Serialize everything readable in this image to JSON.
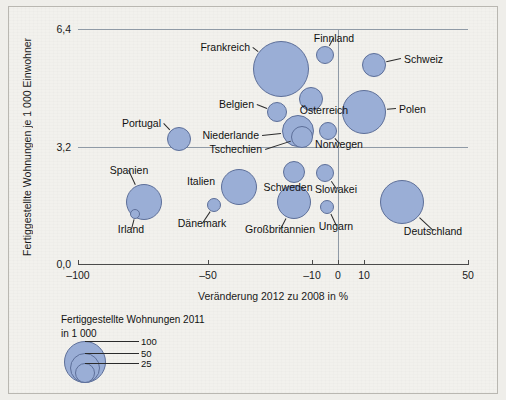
{
  "chart_data": {
    "type": "scatter",
    "title": "",
    "xlabel": "Veränderung 2012 zu 2008 in %",
    "ylabel": "Fertiggestellte Wohnungen je 1 000 Einwohner",
    "xlim": [
      -100,
      50
    ],
    "ylim": [
      0.0,
      6.4
    ],
    "xticks": [
      "-100",
      "-50",
      "-10",
      "0",
      "10",
      "50"
    ],
    "xtick_values": [
      -100,
      -50,
      -10,
      0,
      10,
      50
    ],
    "yticks": [
      "6,4",
      "3,2",
      "0,0"
    ],
    "ytick_values": [
      6.4,
      3.2,
      0.0
    ],
    "grid": true,
    "legend_position": "below-left",
    "size_legend": {
      "title_line1": "Fertiggestellte Wohnungen 2011",
      "title_line2": "in 1 000",
      "values": [
        "100",
        "50",
        "25"
      ]
    },
    "size_unit": "1000 Wohnungen (2011)",
    "points": [
      {
        "label": "Frankreich",
        "x": -22.0,
        "y": 5.35,
        "size": 100,
        "px": 272,
        "py": 62,
        "r": 28,
        "label_side": "r",
        "lx": 241,
        "ly": 40
      },
      {
        "label": "Finnland",
        "x": -9.5,
        "y": 5.8,
        "size": 15,
        "px": 316,
        "py": 48,
        "r": 9,
        "label_side": "c",
        "lx": 325,
        "ly": 31
      },
      {
        "label": "Schweiz",
        "x": 7.0,
        "y": 5.45,
        "size": 22,
        "px": 365,
        "py": 58,
        "r": 12,
        "label_side": "l",
        "lx": 395,
        "ly": 52
      },
      {
        "label": "Belgien",
        "x": -23.5,
        "y": 4.25,
        "size": 18,
        "px": 268,
        "py": 105,
        "r": 10,
        "label_side": "r",
        "lx": 245,
        "ly": 97
      },
      {
        "label": "Österreich",
        "x": -13.0,
        "y": 4.35,
        "size": 22,
        "px": 302,
        "py": 92,
        "r": 12,
        "label_side": "c",
        "lx": 315,
        "ly": 103
      },
      {
        "label": "Polen",
        "x": 1.5,
        "y": 4.25,
        "size": 70,
        "px": 355,
        "py": 105,
        "r": 22,
        "label_side": "l",
        "lx": 390,
        "ly": 102
      },
      {
        "label": "Portugal",
        "x": -61.0,
        "y": 3.6,
        "size": 27,
        "px": 170,
        "py": 132,
        "r": 12,
        "label_side": "r",
        "lx": 152,
        "ly": 116
      },
      {
        "label": "Niederlande",
        "x": -17.0,
        "y": 3.75,
        "size": 55,
        "px": 289,
        "py": 124,
        "r": 16,
        "label_side": "r",
        "lx": 250,
        "ly": 128
      },
      {
        "label": "Tschechien",
        "x": -16.0,
        "y": 3.55,
        "size": 30,
        "px": 293,
        "py": 130,
        "r": 11,
        "label_side": "r",
        "lx": 253,
        "ly": 142
      },
      {
        "label": "Norwegen",
        "x": -9.0,
        "y": 3.8,
        "size": 14,
        "px": 319,
        "py": 124,
        "r": 9,
        "label_side": "c",
        "lx": 330,
        "ly": 137
      },
      {
        "label": "Spanien",
        "x": -78.0,
        "y": 2.35,
        "size": 57,
        "px": 135,
        "py": 195,
        "r": 18,
        "label_side": "c",
        "lx": 120,
        "ly": 163
      },
      {
        "label": "Irland",
        "x": -81.0,
        "y": 2.05,
        "size": 7,
        "px": 126,
        "py": 207,
        "r": 5,
        "label_side": "c",
        "lx": 122,
        "ly": 222
      },
      {
        "label": "Italien",
        "x": -42.0,
        "y": 2.65,
        "size": 65,
        "px": 230,
        "py": 180,
        "r": 18,
        "label_side": "r",
        "lx": 206,
        "ly": 174
      },
      {
        "label": "Dänemark",
        "x": -56.0,
        "y": 2.3,
        "size": 10,
        "px": 205,
        "py": 198,
        "r": 7,
        "label_side": "c",
        "lx": 193,
        "ly": 216
      },
      {
        "label": "Schweden",
        "x": -18.0,
        "y": 2.75,
        "size": 20,
        "px": 285,
        "py": 165,
        "r": 11,
        "label_side": "c",
        "lx": 279,
        "ly": 180
      },
      {
        "label": "Slowakei",
        "x": -10.0,
        "y": 2.7,
        "size": 14,
        "px": 316,
        "py": 166,
        "r": 9,
        "label_side": "c",
        "lx": 327,
        "ly": 182
      },
      {
        "label": "Großbritannien",
        "x": -19.0,
        "y": 2.2,
        "size": 55,
        "px": 285,
        "py": 195,
        "r": 17,
        "label_side": "c",
        "lx": 271,
        "ly": 222
      },
      {
        "label": "Ungarn",
        "x": -8.5,
        "y": 2.15,
        "size": 10,
        "px": 318,
        "py": 200,
        "r": 7,
        "label_side": "c",
        "lx": 327,
        "ly": 219
      },
      {
        "label": "Deutschland",
        "x": 17.0,
        "y": 2.25,
        "size": 70,
        "px": 393,
        "py": 195,
        "r": 22,
        "label_side": "c",
        "lx": 424,
        "ly": 224
      }
    ]
  }
}
